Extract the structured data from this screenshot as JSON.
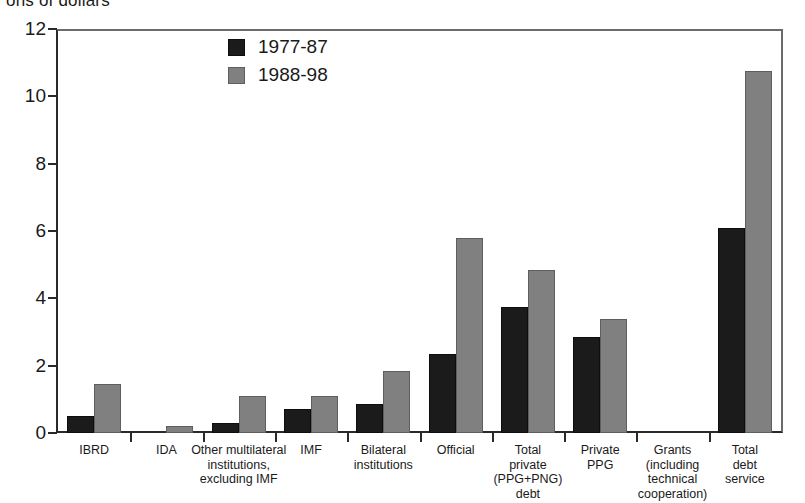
{
  "chart_data": {
    "type": "bar",
    "title_visible_text": "ons of dollars",
    "xlabel": "",
    "ylabel": "Billions of dollars",
    "ylim": [
      0,
      12
    ],
    "yticks": [
      0,
      2,
      4,
      6,
      8,
      10,
      12
    ],
    "ytick_labels": [
      "0",
      "2",
      "4",
      "6",
      "8",
      "10",
      "12"
    ],
    "grid": false,
    "legend_position": "top-center",
    "categories": [
      "IBRD",
      "IDA",
      "Other multilateral institutions, excluding IMF",
      "IMF",
      "Bilateral institutions",
      "Official",
      "Total private (PPG+PNG) debt",
      "Private PPG",
      "Grants (including technical cooperation)",
      "Total debt service"
    ],
    "category_label_lines": [
      [
        "IBRD"
      ],
      [
        "IDA"
      ],
      [
        "Other multilateral",
        "institutions,",
        "excluding IMF"
      ],
      [
        "IMF"
      ],
      [
        "Bilateral",
        "institutions"
      ],
      [
        "Official"
      ],
      [
        "Total",
        "private",
        "(PPG+PNG)",
        "debt"
      ],
      [
        "Private",
        "PPG"
      ],
      [
        "Grants",
        "(including",
        "technical",
        "cooperation)"
      ],
      [
        "Total",
        "debt",
        "service"
      ]
    ],
    "series": [
      {
        "name": "1977-87",
        "color": "#1b1b1b",
        "values": [
          0.5,
          0.0,
          0.3,
          0.7,
          0.85,
          2.35,
          3.75,
          2.85,
          0.0,
          6.1
        ]
      },
      {
        "name": "1988-98",
        "color": "#808080",
        "values": [
          1.45,
          0.22,
          1.1,
          1.1,
          1.85,
          5.8,
          4.85,
          3.4,
          0.0,
          10.75
        ]
      }
    ]
  },
  "legend": {
    "entries": [
      {
        "label": "1977-87",
        "swatch": "black-square"
      },
      {
        "label": "1988-98",
        "swatch": "gray-square"
      }
    ]
  },
  "colors": {
    "series_1977_87": "#1b1b1b",
    "series_1988_98": "#808080",
    "axis": "#2a2a2a",
    "background": "#ffffff"
  }
}
